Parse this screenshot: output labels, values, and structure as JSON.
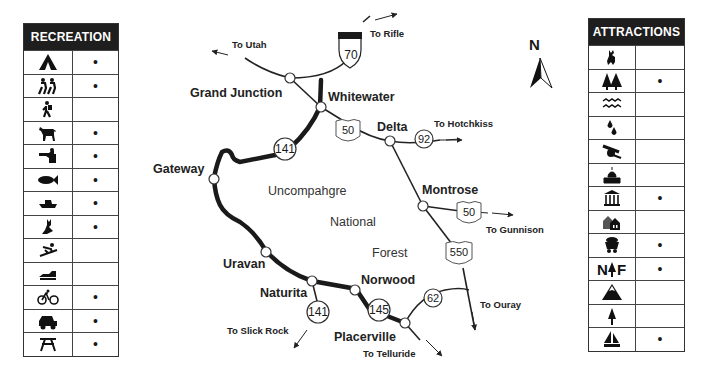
{
  "recreation": {
    "title": "RECREATION",
    "rows": [
      {
        "icon": "camping-icon",
        "available": "•"
      },
      {
        "icon": "hiking-group-icon",
        "available": "•"
      },
      {
        "icon": "hiker-icon",
        "available": ""
      },
      {
        "icon": "horseback-riding-icon",
        "available": "•"
      },
      {
        "icon": "hunting-icon",
        "available": "•"
      },
      {
        "icon": "fishing-icon",
        "available": "•"
      },
      {
        "icon": "boating-icon",
        "available": "•"
      },
      {
        "icon": "wildlife-viewing-icon",
        "available": "•"
      },
      {
        "icon": "skiing-icon",
        "available": ""
      },
      {
        "icon": "snowmobile-icon",
        "available": ""
      },
      {
        "icon": "bicycling-icon",
        "available": "•"
      },
      {
        "icon": "four-wheel-drive-icon",
        "available": "•"
      },
      {
        "icon": "picnic-icon",
        "available": "•"
      }
    ]
  },
  "attractions": {
    "title": "ATTRACTIONS",
    "rows": [
      {
        "icon": "wildlife-moose-icon",
        "available": ""
      },
      {
        "icon": "forest-icon",
        "available": "•"
      },
      {
        "icon": "rivers-icon",
        "available": ""
      },
      {
        "icon": "hot-springs-icon",
        "available": ""
      },
      {
        "icon": "historic-cannon-icon",
        "available": ""
      },
      {
        "icon": "capitol-icon",
        "available": ""
      },
      {
        "icon": "museum-icon",
        "available": "•"
      },
      {
        "icon": "historic-buildings-icon",
        "available": ""
      },
      {
        "icon": "mining-cart-icon",
        "available": "•"
      },
      {
        "icon": "national-forest-icon",
        "available": "•"
      },
      {
        "icon": "mountain-icon",
        "available": ""
      },
      {
        "icon": "tree-icon",
        "available": ""
      },
      {
        "icon": "sailing-icon",
        "available": "•"
      }
    ]
  },
  "map": {
    "north_label": "N",
    "cities": {
      "grand_junction": "Grand Junction",
      "whitewater": "Whitewater",
      "delta": "Delta",
      "gateway": "Gateway",
      "montrose": "Montrose",
      "uravan": "Uravan",
      "naturita": "Naturita",
      "norwood": "Norwood",
      "placerville": "Placerville"
    },
    "destinations": {
      "utah": "To Utah",
      "rifle": "To Rifle",
      "hotchkiss": "To Hotchkiss",
      "gunnison": "To Gunnison",
      "ouray": "To Ouray",
      "slick_rock": "To Slick Rock",
      "telluride": "To Telluride"
    },
    "area": [
      "Uncompahgre",
      "National",
      "Forest"
    ],
    "routes": {
      "i70": "70",
      "us50_a": "50",
      "us50_b": "50",
      "co92": "92",
      "co141_a": "141",
      "co141_b": "141",
      "co145": "145",
      "us550": "550",
      "co62": "62"
    }
  }
}
